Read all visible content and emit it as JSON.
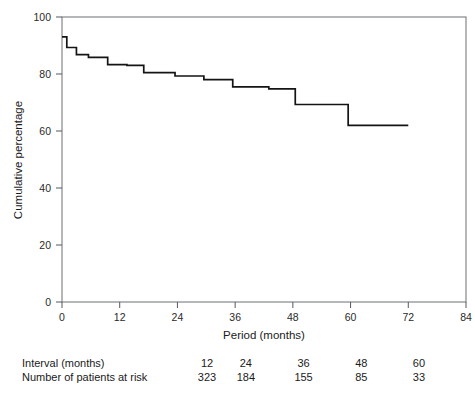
{
  "chart_data": {
    "type": "line",
    "subtype": "kaplan-meier-step",
    "title": "",
    "xlabel": "Period (months)",
    "ylabel": "Cumulative percentage",
    "xlim": [
      0,
      84
    ],
    "ylim": [
      0,
      100
    ],
    "xticks": [
      0,
      12,
      24,
      36,
      48,
      60,
      72,
      84
    ],
    "yticks": [
      0,
      20,
      40,
      60,
      80,
      100
    ],
    "xtick_labels": [
      "0",
      "12",
      "24",
      "36",
      "48",
      "60",
      "72",
      "84"
    ],
    "ytick_labels": [
      "0",
      "20",
      "40",
      "60",
      "80",
      "100"
    ],
    "grid": false,
    "legend": "none",
    "series": [
      {
        "name": "Cumulative percentage",
        "x": [
          0,
          1.0,
          1.0,
          3.0,
          3.0,
          5.5,
          5.5,
          9.5,
          9.5,
          13.5,
          13.5,
          17.0,
          17.0,
          23.5,
          23.5,
          29.5,
          29.5,
          35.5,
          35.5,
          43.0,
          43.0,
          48.5,
          48.5,
          59.5,
          59.5,
          72.0
        ],
        "y": [
          93.0,
          93.0,
          89.3,
          89.3,
          86.8,
          86.8,
          85.8,
          85.8,
          83.3,
          83.3,
          83.0,
          83.0,
          80.5,
          80.5,
          79.3,
          79.3,
          78.0,
          78.0,
          75.5,
          75.5,
          74.8,
          74.8,
          69.3,
          69.3,
          62.0,
          62.0
        ],
        "color": "#141414"
      }
    ],
    "risk_table": {
      "rows": [
        {
          "label": "Interval (months)",
          "values": [
            "12",
            "24",
            "36",
            "48",
            "60"
          ]
        },
        {
          "label": "Number of patients at risk",
          "values": [
            "323",
            "184",
            "155",
            "85",
            "33"
          ]
        }
      ]
    }
  }
}
